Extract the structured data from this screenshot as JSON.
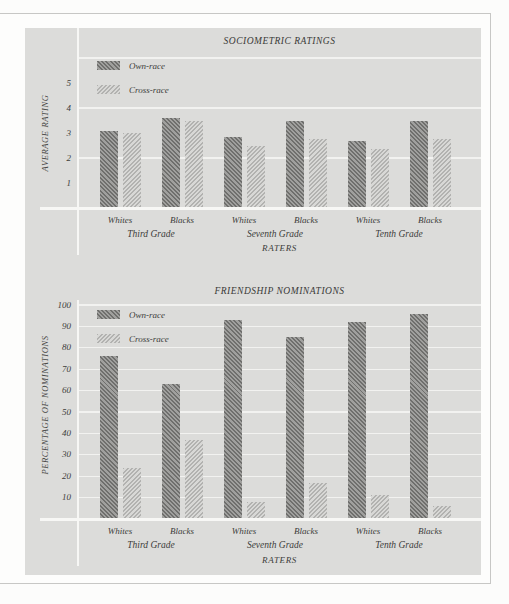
{
  "figure": {
    "background_color": "#dcdcda",
    "bar_colors": {
      "own_race": "#8a8a88",
      "cross_race": "#c9c9c7"
    },
    "gridline_color": "#f2f2f0",
    "border_color": "#c7c7c5"
  },
  "chart_data": [
    {
      "type": "bar",
      "title": "SOCIOMETRIC RATINGS",
      "ylabel": "AVERAGE RATING",
      "xlabel": "RATERS",
      "ylim": [
        0,
        6.4
      ],
      "yticks": [
        1,
        2,
        3,
        4,
        5
      ],
      "gridline_values": [
        2,
        4,
        6
      ],
      "legend_position": "top-left",
      "categories": [
        "Whites",
        "Blacks",
        "Whites",
        "Blacks",
        "Whites",
        "Blacks"
      ],
      "group_labels": [
        "Third Grade",
        "Seventh Grade",
        "Tenth Grade"
      ],
      "series": [
        {
          "name": "Own-race",
          "values": [
            3.1,
            3.6,
            2.85,
            3.5,
            2.7,
            3.5
          ]
        },
        {
          "name": "Cross-race",
          "values": [
            3.0,
            3.5,
            2.5,
            2.75,
            2.35,
            2.75
          ]
        }
      ]
    },
    {
      "type": "bar",
      "title": "FRIENDSHIP NOMINATIONS",
      "ylabel": "PERCENTAGE OF NOMINATIONS",
      "xlabel": "RATERS",
      "ylim": [
        0,
        103
      ],
      "yticks": [
        10,
        20,
        30,
        40,
        50,
        60,
        70,
        80,
        90,
        100
      ],
      "gridline_values": [
        10,
        20,
        30,
        40,
        50,
        60,
        70,
        80,
        90,
        100
      ],
      "legend_position": "top-left",
      "categories": [
        "Whites",
        "Blacks",
        "Whites",
        "Blacks",
        "Whites",
        "Blacks"
      ],
      "group_labels": [
        "Third Grade",
        "Seventh Grade",
        "Tenth Grade"
      ],
      "series": [
        {
          "name": "Own-race",
          "values": [
            76,
            63,
            93,
            85,
            92,
            96
          ]
        },
        {
          "name": "Cross-race",
          "values": [
            24,
            37,
            8,
            17,
            11,
            6
          ]
        }
      ]
    }
  ]
}
